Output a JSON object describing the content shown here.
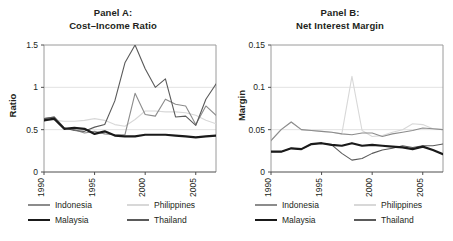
{
  "figure": {
    "background_color": "#ffffff",
    "text_color": "#231f20"
  },
  "series_styles": {
    "indonesia": {
      "color": "#8c8c8c",
      "width": 1.1
    },
    "philippines": {
      "color": "#d8d8d8",
      "width": 1.1
    },
    "malaysia": {
      "color": "#1a1a1a",
      "width": 2.2
    },
    "thailand": {
      "color": "#5a5a5a",
      "width": 1.1
    }
  },
  "panel_a": {
    "title_line1": "Panel A:",
    "title_line2": "Cost–Income Ratio",
    "ylabel": "Ratio",
    "legend": [
      {
        "key": "indonesia",
        "label": "Indonesia"
      },
      {
        "key": "philippines",
        "label": "Philippines"
      },
      {
        "key": "malaysia",
        "label": "Malaysia"
      },
      {
        "key": "thailand",
        "label": "Thailand"
      }
    ]
  },
  "panel_b": {
    "title_line1": "Panel B:",
    "title_line2": "Net Interest Margin",
    "ylabel": "Margin",
    "legend": [
      {
        "key": "indonesia",
        "label": "Indonesia"
      },
      {
        "key": "philippines",
        "label": "Philippines"
      },
      {
        "key": "malaysia",
        "label": "Malaysia"
      },
      {
        "key": "thailand",
        "label": "Thailand"
      }
    ]
  },
  "chart_data": [
    {
      "type": "line",
      "id": "panel-a",
      "title": "Panel A: Cost–Income Ratio",
      "xlabel": "",
      "ylabel": "Ratio",
      "xlim": [
        1990,
        2007
      ],
      "ylim": [
        0,
        1.5
      ],
      "yticks": [
        0,
        0.5,
        1,
        1.5
      ],
      "ytick_labels": [
        "0",
        "0.5",
        "1",
        "1.5"
      ],
      "xticks": [
        1990,
        1995,
        2000,
        2005
      ],
      "xtick_labels": [
        "1990",
        "1995",
        "2000",
        "2005"
      ],
      "grid": "horizontal",
      "legend_position": "below",
      "x": [
        1990,
        1991,
        1992,
        1993,
        1994,
        1995,
        1996,
        1997,
        1998,
        1999,
        2000,
        2001,
        2002,
        2003,
        2004,
        2005,
        2006,
        2007
      ],
      "series": [
        {
          "name": "Indonesia",
          "values": [
            0.63,
            0.65,
            0.52,
            0.5,
            0.46,
            0.48,
            0.45,
            0.44,
            0.44,
            0.93,
            0.68,
            0.66,
            0.86,
            0.8,
            0.78,
            0.56,
            0.78,
            0.67
          ]
        },
        {
          "name": "Philippines",
          "values": [
            0.61,
            0.61,
            0.6,
            0.6,
            0.61,
            0.63,
            0.61,
            0.56,
            0.54,
            0.62,
            0.72,
            0.72,
            0.71,
            0.71,
            0.7,
            0.67,
            0.61,
            0.57
          ]
        },
        {
          "name": "Malaysia",
          "values": [
            0.61,
            0.63,
            0.51,
            0.52,
            0.51,
            0.45,
            0.48,
            0.43,
            0.42,
            0.42,
            0.44,
            0.44,
            0.44,
            0.43,
            0.42,
            0.41,
            0.42,
            0.43
          ]
        },
        {
          "name": "Thailand",
          "values": [
            0.63,
            0.65,
            0.52,
            0.49,
            0.48,
            0.53,
            0.56,
            0.84,
            1.29,
            1.5,
            1.22,
            1.0,
            1.1,
            0.65,
            0.66,
            0.55,
            0.86,
            1.04
          ]
        }
      ]
    },
    {
      "type": "line",
      "id": "panel-b",
      "title": "Panel B: Net Interest Margin",
      "xlabel": "",
      "ylabel": "Margin",
      "xlim": [
        1990,
        2007
      ],
      "ylim": [
        0,
        0.15
      ],
      "yticks": [
        0,
        0.05,
        0.1,
        0.15
      ],
      "ytick_labels": [
        "0",
        "0.05",
        "0.1",
        "0.15"
      ],
      "xticks": [
        1990,
        1995,
        2000,
        2005
      ],
      "xtick_labels": [
        "1990",
        "1995",
        "2000",
        "2005"
      ],
      "grid": "horizontal",
      "legend_position": "below",
      "x": [
        1990,
        1991,
        1992,
        1993,
        1994,
        1995,
        1996,
        1997,
        1998,
        1999,
        2000,
        2001,
        2002,
        2003,
        2004,
        2005,
        2006,
        2007
      ],
      "series": [
        {
          "name": "Indonesia",
          "values": [
            0.037,
            0.05,
            0.059,
            0.05,
            0.049,
            0.048,
            0.047,
            0.045,
            0.044,
            0.046,
            0.046,
            0.042,
            0.045,
            0.047,
            0.049,
            0.052,
            0.051,
            0.05
          ]
        },
        {
          "name": "Philippines",
          "values": [
            0.037,
            0.05,
            0.059,
            0.05,
            0.049,
            0.048,
            0.047,
            0.045,
            0.113,
            0.049,
            0.042,
            0.043,
            0.047,
            0.05,
            0.057,
            0.056,
            0.051,
            0.05
          ]
        },
        {
          "name": "Malaysia",
          "values": [
            0.024,
            0.024,
            0.028,
            0.027,
            0.033,
            0.034,
            0.032,
            0.031,
            0.034,
            0.031,
            0.032,
            0.031,
            0.03,
            0.029,
            0.027,
            0.03,
            0.026,
            0.021
          ]
        },
        {
          "name": "Thailand",
          "values": [
            0.024,
            0.024,
            0.028,
            0.027,
            0.033,
            0.034,
            0.032,
            0.022,
            0.014,
            0.016,
            0.022,
            0.026,
            0.028,
            0.031,
            0.029,
            0.031,
            0.031,
            0.033
          ]
        }
      ]
    }
  ]
}
